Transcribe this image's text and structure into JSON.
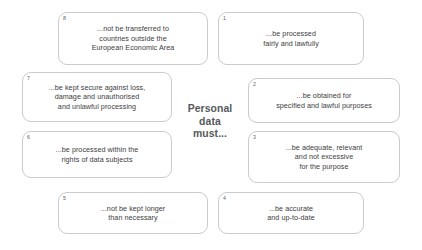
{
  "diagram": {
    "center_label": "Personal\ndata\nmust...",
    "boxes": [
      {
        "number": "1",
        "text": "...be processed\nfairly and lawfully",
        "name": "principle-box-1"
      },
      {
        "number": "2",
        "text": "...be obtained for\nspecified and lawful purposes",
        "name": "principle-box-2"
      },
      {
        "number": "3",
        "text": "...be adequate, relevant\nand not excessive\nfor the purpose",
        "name": "principle-box-3"
      },
      {
        "number": "4",
        "text": "...be accurate\nand up-to-date",
        "name": "principle-box-4"
      },
      {
        "number": "5",
        "text": "...not be kept longer\nthan necessary",
        "name": "principle-box-5"
      },
      {
        "number": "6",
        "text": "...be processed within the\nrights of data subjects",
        "name": "principle-box-6"
      },
      {
        "number": "7",
        "text": "...be kept secure against loss,\ndamage and unauthorised\nand unlawful processing",
        "name": "principle-box-7"
      },
      {
        "number": "8",
        "text": "...not be transferred to\ncountries outside the\nEuropean Economic Area",
        "name": "principle-box-8"
      }
    ],
    "colors": {
      "box_border": "#c9cbcc",
      "box_background": "#ffffff",
      "body_text": "#3c3c3e",
      "number_text": "#5d6164",
      "center_text": "#55595c",
      "page_background": "#ffffff"
    }
  }
}
